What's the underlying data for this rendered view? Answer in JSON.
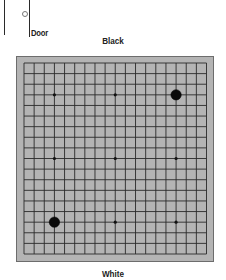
{
  "door": {
    "label": "Door"
  },
  "players": {
    "top": "Black",
    "bottom": "White"
  },
  "board": {
    "size": 19,
    "background_color": "#b4b4b4",
    "line_color": "#2a2a2a",
    "hoshi": [
      [
        3,
        3
      ],
      [
        9,
        3
      ],
      [
        15,
        3
      ],
      [
        3,
        9
      ],
      [
        9,
        9
      ],
      [
        15,
        9
      ],
      [
        3,
        15
      ],
      [
        9,
        15
      ],
      [
        15,
        15
      ]
    ],
    "stones": [
      {
        "color": "black",
        "col": 15,
        "row": 3
      },
      {
        "color": "black",
        "col": 3,
        "row": 15
      }
    ]
  }
}
